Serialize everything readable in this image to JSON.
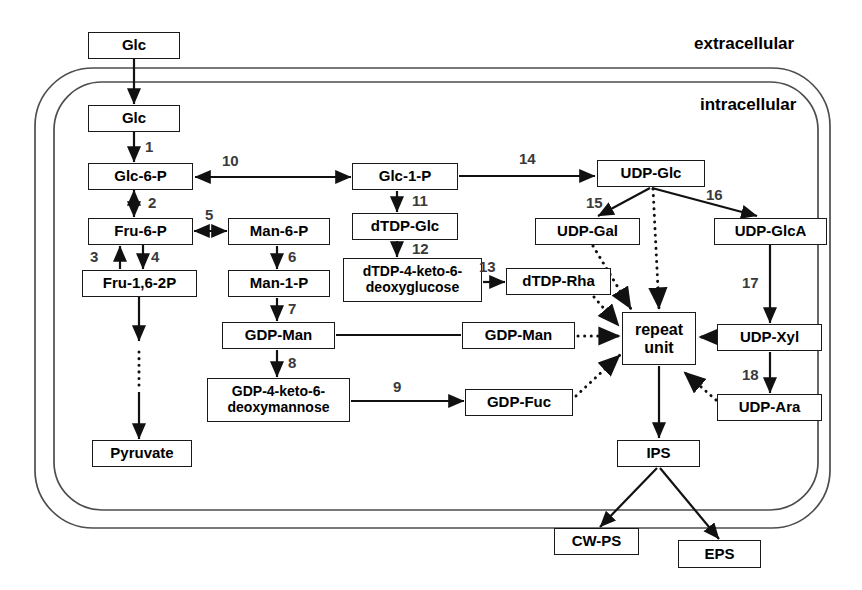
{
  "diagram": {
    "region_labels": [
      {
        "id": "extracellular",
        "text": "extracellular",
        "x": 694,
        "y": 34
      },
      {
        "id": "intracellular",
        "text": "intracellular",
        "x": 700,
        "y": 95
      }
    ],
    "membrane": {
      "outer": {
        "x": 35,
        "y": 68,
        "w": 795,
        "h": 460,
        "rx": 58
      },
      "inner": {
        "x": 54,
        "y": 82,
        "w": 764,
        "h": 428,
        "rx": 48
      },
      "color": "#4d4d4d"
    },
    "nodes": [
      {
        "id": "glc-out",
        "label": "Glc",
        "x": 88,
        "y": 32,
        "w": 92,
        "h": 27,
        "font": 15
      },
      {
        "id": "glc-in",
        "label": "Glc",
        "x": 88,
        "y": 105,
        "w": 92,
        "h": 27,
        "font": 15
      },
      {
        "id": "glc-6-p",
        "label": "Glc-6-P",
        "x": 88,
        "y": 163,
        "w": 105,
        "h": 27,
        "font": 15
      },
      {
        "id": "fru-6-p",
        "label": "Fru-6-P",
        "x": 88,
        "y": 218,
        "w": 105,
        "h": 27,
        "font": 15
      },
      {
        "id": "fru-16-2p",
        "label": "Fru-1,6-2P",
        "x": 82,
        "y": 270,
        "w": 115,
        "h": 27,
        "font": 15
      },
      {
        "id": "pyruvate",
        "label": "Pyruvate",
        "x": 92,
        "y": 440,
        "w": 100,
        "h": 27,
        "font": 15
      },
      {
        "id": "man-6-p",
        "label": "Man-6-P",
        "x": 228,
        "y": 218,
        "w": 102,
        "h": 27,
        "font": 15
      },
      {
        "id": "man-1-p",
        "label": "Man-1-P",
        "x": 228,
        "y": 270,
        "w": 102,
        "h": 27,
        "font": 15
      },
      {
        "id": "gdp-man",
        "label": "GDP-Man",
        "x": 222,
        "y": 322,
        "w": 113,
        "h": 27,
        "font": 15
      },
      {
        "id": "gdp-4-keto",
        "label": "GDP-4-keto-6-\ndeoxymannose",
        "x": 207,
        "y": 378,
        "w": 143,
        "h": 44,
        "font": 14
      },
      {
        "id": "glc-1-p",
        "label": "Glc-1-P",
        "x": 352,
        "y": 163,
        "w": 106,
        "h": 27,
        "font": 15
      },
      {
        "id": "dtdp-glc",
        "label": "dTDP-Glc",
        "x": 352,
        "y": 213,
        "w": 106,
        "h": 27,
        "font": 15
      },
      {
        "id": "dtdp-4-keto",
        "label": "dTDP-4-keto-6-\ndeoxyglucose",
        "x": 343,
        "y": 258,
        "w": 139,
        "h": 44,
        "font": 14
      },
      {
        "id": "dtdp-rha",
        "label": "dTDP-Rha",
        "x": 506,
        "y": 268,
        "w": 105,
        "h": 27,
        "font": 15
      },
      {
        "id": "gdp-man-2",
        "label": "GDP-Man",
        "x": 462,
        "y": 322,
        "w": 113,
        "h": 27,
        "font": 15
      },
      {
        "id": "gdp-fuc",
        "label": "GDP-Fuc",
        "x": 465,
        "y": 389,
        "w": 108,
        "h": 27,
        "font": 15
      },
      {
        "id": "udp-glc",
        "label": "UDP-Glc",
        "x": 597,
        "y": 160,
        "w": 108,
        "h": 27,
        "font": 15
      },
      {
        "id": "udp-gal",
        "label": "UDP-Gal",
        "x": 535,
        "y": 218,
        "w": 105,
        "h": 27,
        "font": 15
      },
      {
        "id": "udp-glca",
        "label": "UDP-GlcA",
        "x": 714,
        "y": 218,
        "w": 113,
        "h": 27,
        "font": 15
      },
      {
        "id": "udp-xyl",
        "label": "UDP-Xyl",
        "x": 717,
        "y": 324,
        "w": 105,
        "h": 27,
        "font": 15
      },
      {
        "id": "udp-ara",
        "label": "UDP-Ara",
        "x": 717,
        "y": 394,
        "w": 105,
        "h": 27,
        "font": 15
      },
      {
        "id": "repeat-unit",
        "label": "repeat\nunit",
        "x": 622,
        "y": 312,
        "w": 74,
        "h": 53,
        "font": 16
      },
      {
        "id": "ips",
        "label": "IPS",
        "x": 617,
        "y": 440,
        "w": 83,
        "h": 27,
        "font": 15
      },
      {
        "id": "cw-ps",
        "label": "CW-PS",
        "x": 554,
        "y": 528,
        "w": 85,
        "h": 27,
        "font": 15
      },
      {
        "id": "eps",
        "label": "EPS",
        "x": 678,
        "y": 540,
        "w": 83,
        "h": 28,
        "font": 15
      }
    ],
    "enzyme_numbers": [
      {
        "id": "enz-1",
        "text": "1",
        "x": 145,
        "y": 138
      },
      {
        "id": "enz-2",
        "text": "2",
        "x": 148,
        "y": 194
      },
      {
        "id": "enz-3",
        "text": "3",
        "x": 90,
        "y": 248
      },
      {
        "id": "enz-4",
        "text": "4",
        "x": 151,
        "y": 248
      },
      {
        "id": "enz-5",
        "text": "5",
        "x": 205,
        "y": 206
      },
      {
        "id": "enz-6",
        "text": "6",
        "x": 288,
        "y": 248
      },
      {
        "id": "enz-7",
        "text": "7",
        "x": 288,
        "y": 300
      },
      {
        "id": "enz-8",
        "text": "8",
        "x": 288,
        "y": 354
      },
      {
        "id": "enz-9",
        "text": "9",
        "x": 393,
        "y": 378
      },
      {
        "id": "enz-10",
        "text": "10",
        "x": 222,
        "y": 152
      },
      {
        "id": "enz-11",
        "text": "11",
        "x": 412,
        "y": 192
      },
      {
        "id": "enz-12",
        "text": "12",
        "x": 412,
        "y": 240
      },
      {
        "id": "enz-13",
        "text": "13",
        "x": 479,
        "y": 258
      },
      {
        "id": "enz-14",
        "text": "14",
        "x": 519,
        "y": 150
      },
      {
        "id": "enz-15",
        "text": "15",
        "x": 586,
        "y": 194
      },
      {
        "id": "enz-16",
        "text": "16",
        "x": 706,
        "y": 186
      },
      {
        "id": "enz-17",
        "text": "17",
        "x": 742,
        "y": 274
      },
      {
        "id": "enz-18",
        "text": "18",
        "x": 742,
        "y": 366
      }
    ],
    "edges": [
      {
        "id": "glc-out-to-glc-in",
        "style": "solid",
        "points": "134,59 134,104",
        "arrow": "end"
      },
      {
        "id": "glc-in-to-glc-6-p",
        "style": "solid",
        "points": "134,132 134,162",
        "arrow": "end"
      },
      {
        "id": "glc-6-p-to-fru-6-p",
        "style": "solid",
        "points": "134,190 134,217",
        "arrow": "both"
      },
      {
        "id": "fru-6-p-to-fru-16-2p",
        "style": "solid",
        "points": "143,245 143,269",
        "arrow": "end"
      },
      {
        "id": "fru-16-2p-to-fru-6-p",
        "style": "solid",
        "points": "120,269 120,246",
        "arrow": "end"
      },
      {
        "id": "fru-16-2p-to-pyruvate-a",
        "style": "solid",
        "points": "139,297 139,341",
        "arrow": "end"
      },
      {
        "id": "fru-16-2p-to-pyruvate-b",
        "style": "dotted",
        "points": "139,352 139,389",
        "arrow": "none"
      },
      {
        "id": "fru-16-2p-to-pyruvate-c",
        "style": "solid",
        "points": "139,392 139,439",
        "arrow": "end"
      },
      {
        "id": "fru-6-p-to-man-6-p",
        "style": "solid",
        "points": "194,231 227,231",
        "arrow": "both"
      },
      {
        "id": "man-6-p-to-man-1-p",
        "style": "solid",
        "points": "277,246 277,269",
        "arrow": "end"
      },
      {
        "id": "man-1-p-to-gdp-man",
        "style": "solid",
        "points": "277,298 277,321",
        "arrow": "end"
      },
      {
        "id": "gdp-man-to-gdp-4-keto",
        "style": "solid",
        "points": "277,350 277,377",
        "arrow": "end"
      },
      {
        "id": "gdp-4-keto-to-gdp-fuc",
        "style": "solid",
        "points": "351,401 464,401",
        "arrow": "end"
      },
      {
        "id": "gdp-man-to-gdp-man-2",
        "style": "solid",
        "points": "336,335 461,335",
        "arrow": "none"
      },
      {
        "id": "glc-6-p-to-glc-1-p",
        "style": "solid",
        "points": "195,177 351,177",
        "arrow": "both"
      },
      {
        "id": "glc-1-p-to-dtdp-glc",
        "style": "solid",
        "points": "397,191 397,212",
        "arrow": "end"
      },
      {
        "id": "dtdp-glc-to-dtdp-4-keto",
        "style": "solid",
        "points": "397,241 397,257",
        "arrow": "end"
      },
      {
        "id": "dtdp-4-keto-to-dtdp-rha",
        "style": "solid",
        "points": "483,282 505,282",
        "arrow": "end"
      },
      {
        "id": "glc-1-p-to-udp-glc",
        "style": "solid",
        "points": "459,176 595,176",
        "arrow": "end"
      },
      {
        "id": "udp-glc-to-udp-gal",
        "style": "solid",
        "points": "650,188 598,216",
        "arrow": "end"
      },
      {
        "id": "udp-glc-to-udp-glca",
        "style": "solid",
        "points": "652,188 757,216",
        "arrow": "end"
      },
      {
        "id": "udp-glca-to-udp-xyl",
        "style": "solid",
        "points": "770,245 770,323",
        "arrow": "end"
      },
      {
        "id": "udp-xyl-to-udp-ara",
        "style": "solid",
        "points": "770,352 770,393",
        "arrow": "end"
      },
      {
        "id": "udp-glc-to-repeat",
        "style": "dotted",
        "points": "653,189 659,309",
        "arrow": "end"
      },
      {
        "id": "udp-gal-to-repeat",
        "style": "dotted",
        "points": "593,246 631,309",
        "arrow": "end"
      },
      {
        "id": "dtdp-rha-to-repeat",
        "style": "dotted",
        "points": "594,297 619,326",
        "arrow": "end"
      },
      {
        "id": "gdp-man-2-to-repeat",
        "style": "dotted",
        "points": "578,336 620,336",
        "arrow": "end"
      },
      {
        "id": "gdp-fuc-to-repeat",
        "style": "dotted",
        "points": "576,396 620,355",
        "arrow": "end"
      },
      {
        "id": "udp-xyl-to-repeat",
        "style": "dotted",
        "points": "715,337 699,337",
        "arrow": "end"
      },
      {
        "id": "udp-ara-to-repeat",
        "style": "dotted",
        "points": "716,400 684,372",
        "arrow": "end"
      },
      {
        "id": "repeat-to-ips",
        "style": "solid",
        "points": "659,366 659,438",
        "arrow": "end"
      },
      {
        "id": "ips-to-cw-ps",
        "style": "solid",
        "points": "657,468 600,527",
        "arrow": "end"
      },
      {
        "id": "ips-to-eps",
        "style": "solid",
        "points": "660,468 719,539",
        "arrow": "end"
      }
    ]
  }
}
